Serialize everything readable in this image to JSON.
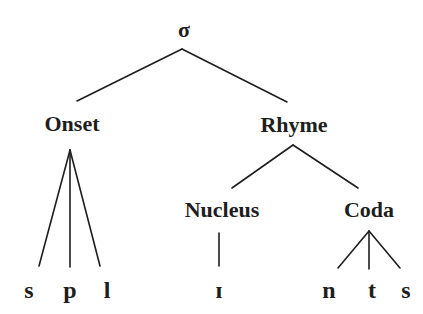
{
  "nodes": {
    "root": {
      "label": "σ",
      "x": 184,
      "y": 30
    },
    "onset": {
      "label": "Onset",
      "x": 72,
      "y": 124
    },
    "rhyme": {
      "label": "Rhyme",
      "x": 294,
      "y": 125
    },
    "nucleus": {
      "label": "Nucleus",
      "x": 222,
      "y": 210
    },
    "coda": {
      "label": "Coda",
      "x": 369,
      "y": 210
    }
  },
  "leaves": [
    {
      "label": "s",
      "x": 29,
      "y": 290,
      "parent": "onset"
    },
    {
      "label": "p",
      "x": 70,
      "y": 290,
      "parent": "onset"
    },
    {
      "label": "l",
      "x": 107,
      "y": 290,
      "parent": "onset"
    },
    {
      "label": "ɪ",
      "x": 219,
      "y": 290,
      "parent": "nucleus"
    },
    {
      "label": "n",
      "x": 329,
      "y": 290,
      "parent": "coda"
    },
    {
      "label": "t",
      "x": 372,
      "y": 290,
      "parent": "coda"
    },
    {
      "label": "s",
      "x": 406,
      "y": 290,
      "parent": "coda"
    }
  ],
  "edges": [
    {
      "from": "root",
      "to": "onset",
      "x1": 182,
      "y1": 49,
      "x2": 77,
      "y2": 101
    },
    {
      "from": "root",
      "to": "rhyme",
      "x1": 182,
      "y1": 49,
      "x2": 287,
      "y2": 102
    },
    {
      "from": "onset",
      "to": "s",
      "x1": 70,
      "y1": 150,
      "x2": 39,
      "y2": 266
    },
    {
      "from": "onset",
      "to": "p",
      "x1": 70,
      "y1": 150,
      "x2": 70,
      "y2": 267
    },
    {
      "from": "onset",
      "to": "l",
      "x1": 70,
      "y1": 150,
      "x2": 100,
      "y2": 266
    },
    {
      "from": "rhyme",
      "to": "nucleus",
      "x1": 293,
      "y1": 145,
      "x2": 232,
      "y2": 188
    },
    {
      "from": "rhyme",
      "to": "coda",
      "x1": 293,
      "y1": 145,
      "x2": 358,
      "y2": 188
    },
    {
      "from": "nucleus",
      "to": "ɪ",
      "x1": 219,
      "y1": 233,
      "x2": 219,
      "y2": 266
    },
    {
      "from": "coda",
      "to": "n",
      "x1": 369,
      "y1": 231,
      "x2": 338,
      "y2": 268
    },
    {
      "from": "coda",
      "to": "t",
      "x1": 369,
      "y1": 231,
      "x2": 369,
      "y2": 269
    },
    {
      "from": "coda",
      "to": "s",
      "x1": 369,
      "y1": 231,
      "x2": 400,
      "y2": 268
    }
  ],
  "colors": {
    "ink": "#1e1e1e",
    "background": "#ffffff"
  }
}
